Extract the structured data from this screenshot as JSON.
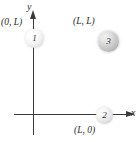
{
  "figure": {
    "axes": {
      "y_label": "y",
      "x_label": "x",
      "origin_marked": false
    },
    "coordinate_labels": [
      {
        "id": "origin-y",
        "text": "(0, L)"
      },
      {
        "id": "corner",
        "text": "(L, L)"
      },
      {
        "id": "origin-x",
        "text": "(L, 0)"
      }
    ],
    "spheres": [
      {
        "id": "sphere-1",
        "label": "1",
        "position": "(0, L)",
        "color": "#efefef"
      },
      {
        "id": "sphere-2",
        "label": "2",
        "position": "(L, 0)",
        "color": "#e6e6e6"
      },
      {
        "id": "sphere-3",
        "label": "3",
        "position": "(L, L)",
        "color": "#c9c9c9"
      }
    ],
    "colors": {
      "axis": "#3a3a3a",
      "text": "#2b2b2b",
      "background": "#ffffff"
    }
  }
}
